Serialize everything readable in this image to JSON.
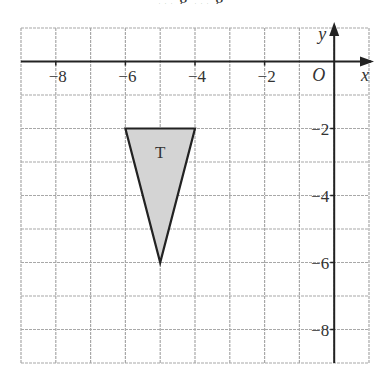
{
  "caption_fragment": "… g … g, ",
  "grid": {
    "x_min": -9,
    "x_max": 1,
    "y_min": -9,
    "y_max": 1,
    "left_px": 21,
    "right_px": 369,
    "top_px": 28,
    "bottom_px": 363,
    "grid_color": "#a8a8a8",
    "axis_color": "#222222"
  },
  "axes": {
    "x_label": "x",
    "y_label": "y",
    "origin_label": "O",
    "x_ticks": [
      {
        "value": -8,
        "label": "−8"
      },
      {
        "value": -6,
        "label": "−6"
      },
      {
        "value": -4,
        "label": "−4"
      },
      {
        "value": -2,
        "label": "−2"
      }
    ],
    "y_ticks": [
      {
        "value": -2,
        "label": "−2"
      },
      {
        "value": -4,
        "label": "−4"
      },
      {
        "value": -6,
        "label": "−6"
      },
      {
        "value": -8,
        "label": "−8"
      }
    ]
  },
  "shape": {
    "name": "T",
    "type": "triangle",
    "vertices": [
      [
        -6,
        -2
      ],
      [
        -4,
        -2
      ],
      [
        -5,
        -6
      ]
    ],
    "fill": "#d4d4d4",
    "stroke": "#222222"
  }
}
